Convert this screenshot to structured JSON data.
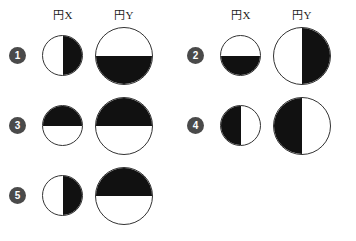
{
  "headers": {
    "circle_x_label": "円X",
    "circle_y_label": "円Y"
  },
  "style": {
    "shade_color": "#111111",
    "outline_color": "#333333",
    "badge_color": "#4a4a4a",
    "badge_text_color": "#ffffff",
    "background_color": "#ffffff"
  },
  "columns": [
    {
      "name": "left-column",
      "items": [
        {
          "number": "1",
          "circle_x": {
            "size": "small",
            "shaded_half": "right"
          },
          "circle_y": {
            "size": "large",
            "shaded_half": "bottom"
          }
        },
        {
          "number": "3",
          "circle_x": {
            "size": "small",
            "shaded_half": "top"
          },
          "circle_y": {
            "size": "large",
            "shaded_half": "top"
          }
        },
        {
          "number": "5",
          "circle_x": {
            "size": "small",
            "shaded_half": "right"
          },
          "circle_y": {
            "size": "large",
            "shaded_half": "top"
          }
        }
      ]
    },
    {
      "name": "right-column",
      "items": [
        {
          "number": "2",
          "circle_x": {
            "size": "small",
            "shaded_half": "bottom"
          },
          "circle_y": {
            "size": "large",
            "shaded_half": "right"
          }
        },
        {
          "number": "4",
          "circle_x": {
            "size": "small",
            "shaded_half": "left"
          },
          "circle_y": {
            "size": "large",
            "shaded_half": "left"
          }
        }
      ]
    }
  ]
}
